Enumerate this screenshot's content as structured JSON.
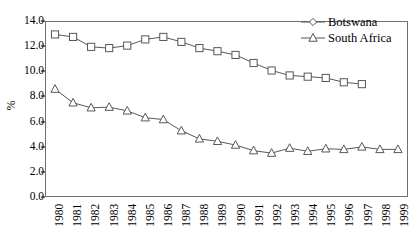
{
  "chart_data": {
    "type": "line",
    "title": "",
    "xlabel": "",
    "ylabel": "%",
    "ylim": [
      0.0,
      14.0
    ],
    "ytick_step": 2.0,
    "yticks": [
      "0.0",
      "2.0",
      "4.0",
      "6.0",
      "8.0",
      "10.0",
      "12.0",
      "14.0"
    ],
    "grid": false,
    "legend_position": "top-right",
    "categories": [
      "1980",
      "1981",
      "1982",
      "1983",
      "1984",
      "1985",
      "1986",
      "1987",
      "1988",
      "1989",
      "1990",
      "1991",
      "1992",
      "1993",
      "1994",
      "1995",
      "1996",
      "1997",
      "1998",
      "1999"
    ],
    "series": [
      {
        "name": "Botswana",
        "marker": "square",
        "color": "#555555",
        "values": [
          13.0,
          12.8,
          12.0,
          11.9,
          12.1,
          12.6,
          12.8,
          12.4,
          11.9,
          11.65,
          11.35,
          10.7,
          10.1,
          9.7,
          9.6,
          9.5,
          9.15,
          9.0,
          null,
          null
        ]
      },
      {
        "name": "South Africa",
        "marker": "triangle",
        "color": "#555555",
        "values": [
          8.6,
          7.5,
          7.1,
          7.15,
          6.85,
          6.3,
          6.15,
          5.25,
          4.6,
          4.4,
          4.1,
          3.65,
          3.45,
          3.85,
          3.6,
          3.8,
          3.75,
          3.95,
          3.75,
          3.75
        ]
      }
    ]
  },
  "legend": {
    "items": [
      {
        "label": "Botswana",
        "marker": "diamond"
      },
      {
        "label": "South Africa",
        "marker": "triangle"
      }
    ]
  },
  "axis": {
    "y_title": "%"
  }
}
